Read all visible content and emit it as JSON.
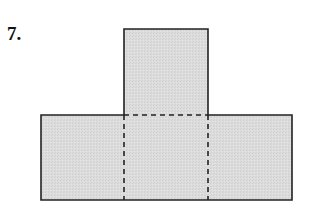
{
  "problem": {
    "number_label": "7."
  },
  "figure": {
    "fill_color": "#dadada",
    "stroke_color": "#222222",
    "faces": [
      {
        "name": "top-square",
        "x": 124,
        "y": 29,
        "width": 84,
        "height": 86
      },
      {
        "name": "bottom-left",
        "x": 41,
        "y": 115,
        "width": 83,
        "height": 85
      },
      {
        "name": "bottom-center",
        "x": 124,
        "y": 115,
        "width": 84,
        "height": 85
      },
      {
        "name": "bottom-right",
        "x": 208,
        "y": 115,
        "width": 84,
        "height": 85
      }
    ],
    "fold_lines": [
      {
        "name": "fold-horizontal-top",
        "x1": 124,
        "y1": 115,
        "x2": 208,
        "y2": 115
      },
      {
        "name": "fold-vertical-left",
        "x1": 124,
        "y1": 115,
        "x2": 124,
        "y2": 200
      },
      {
        "name": "fold-vertical-right",
        "x1": 208,
        "y1": 115,
        "x2": 208,
        "y2": 200
      }
    ]
  }
}
